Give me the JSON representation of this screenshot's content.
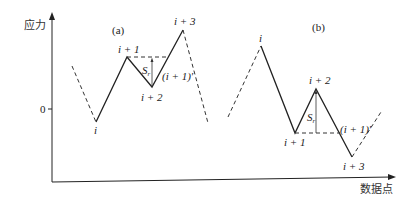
{
  "axes": {
    "y_label": "应力",
    "x_label": "数据点",
    "zero_tick": "0"
  },
  "panel_a": {
    "title": "(a)",
    "points": {
      "i": "i",
      "i1": "i + 1",
      "i2": "i + 2",
      "i3": "i + 3"
    },
    "range_label": "S",
    "range_sub": "r",
    "prime_label": "(i + 1)'"
  },
  "panel_b": {
    "title": "(b)",
    "points": {
      "i": "i",
      "i1": "i + 1",
      "i2": "i + 2",
      "i3": "i + 3"
    },
    "range_label": "S",
    "range_sub": "r",
    "prime_label": "(i + 1)'"
  }
}
